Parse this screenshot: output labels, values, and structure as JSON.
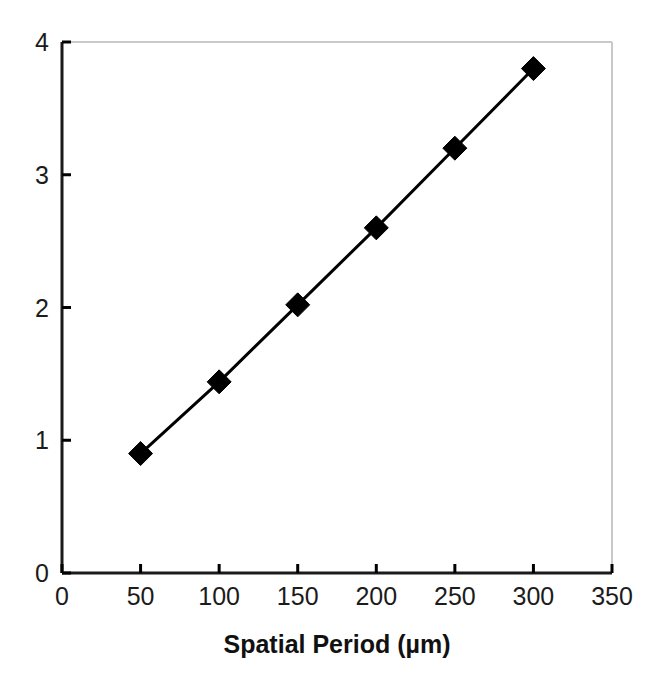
{
  "chart_data": {
    "type": "line",
    "title": "",
    "subtitle": "",
    "xlabel": "Spatial Period (µm)",
    "ylabel": "",
    "x": [
      50,
      100,
      150,
      200,
      250,
      300
    ],
    "series": [
      {
        "name": "measured",
        "values": [
          0.9,
          1.44,
          2.02,
          2.6,
          3.2,
          3.8
        ],
        "marker": "diamond",
        "marker_color": "#000000",
        "line_color": "#000000",
        "line_width": 3
      }
    ],
    "xlim": [
      0,
      350
    ],
    "ylim": [
      0,
      4
    ],
    "xticks": [
      0,
      50,
      100,
      150,
      200,
      250,
      300,
      350
    ],
    "xtick_labels": [
      "0",
      "50",
      "100",
      "150",
      "200",
      "250",
      "300",
      "350"
    ],
    "yticks": [
      0,
      1,
      2,
      3,
      4
    ],
    "ytick_labels": [
      "0",
      "1",
      "2",
      "3",
      "4"
    ],
    "grid": false,
    "legend": false,
    "legend_position": "none",
    "axis_color": "#000000",
    "frame_color": "#c8c8c8",
    "background": "#ffffff"
  },
  "axes": {
    "x_axis_name": "x-axis",
    "y_axis_name": "y-axis"
  }
}
